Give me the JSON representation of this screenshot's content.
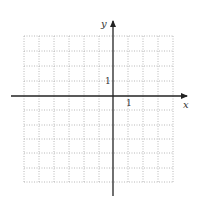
{
  "diagram": {
    "type": "coordinate-grid",
    "x_axis_label": "x",
    "y_axis_label": "y",
    "x_tick_label": "1",
    "y_tick_label": "1",
    "grid": {
      "columns_left_of_origin": 6,
      "columns_right_of_origin": 4,
      "rows_above_origin": 4,
      "rows_below_origin": 6,
      "unit": 1
    },
    "colors": {
      "grid": "#b8b8b8",
      "axis": "#222222",
      "background": "#ffffff"
    }
  }
}
